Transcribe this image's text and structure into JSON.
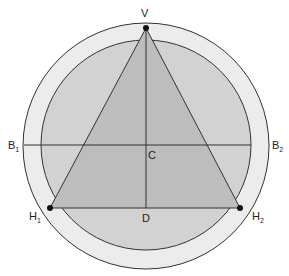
{
  "diagram": {
    "colors": {
      "outer_ring": "#ececec",
      "inner_disc": "#d2d2d2",
      "triangle": "#bdbdbd",
      "stroke": "#333333",
      "point": "#111111"
    },
    "labels": {
      "V": "V",
      "C": "C",
      "D": "D",
      "B1": {
        "base": "B",
        "sub": "1"
      },
      "B2": {
        "base": "B",
        "sub": "2"
      },
      "H1": {
        "base": "H",
        "sub": "1"
      },
      "H2": {
        "base": "H",
        "sub": "2"
      }
    },
    "points": {
      "V": [
        146,
        28
      ],
      "H1": [
        50,
        208
      ],
      "H2": [
        240,
        208
      ],
      "C": [
        146,
        145
      ],
      "D": [
        146,
        208
      ]
    },
    "circles": {
      "outer": {
        "cx": 146,
        "cy": 146,
        "r": 123
      },
      "inner": {
        "cx": 146,
        "cy": 145,
        "r": 105
      }
    }
  }
}
